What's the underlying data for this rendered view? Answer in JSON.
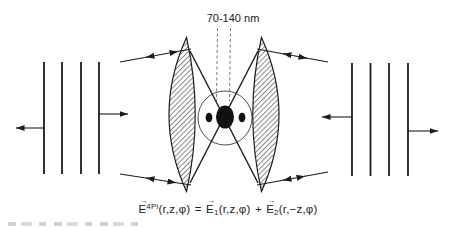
{
  "figure": {
    "top_label": "70-140 nm",
    "equation": {
      "e_symbol": "E",
      "vector_arrow": "→",
      "lhs_sup": "4Pi",
      "lhs_args": "(r,z,φ)",
      "equals": "=",
      "term1_sub": "1",
      "term1_args": "(r,z,φ)",
      "plus": "+",
      "term2_sub": "2",
      "term2_args": "(r,−z,φ)"
    },
    "colors": {
      "ink": "#1c1c1c",
      "hatch": "#2e2e2e",
      "dashed_guide": "#787878",
      "background": "#ffffff"
    }
  }
}
